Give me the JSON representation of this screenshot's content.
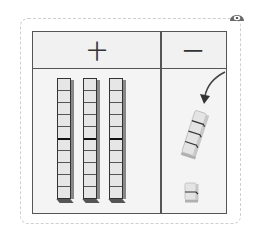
{
  "table": {
    "headers": [
      {
        "label": "十",
        "meaning": "tens"
      },
      {
        "label": "一",
        "meaning": "ones"
      }
    ],
    "tens_rods": 3,
    "rod_cells": 10,
    "ones_stack_cubes": 4,
    "ones_single_cubes": 1,
    "arrow": "curved arrow pointing down-left to tilted stack"
  },
  "icons": {
    "corner": "eye-icon"
  },
  "colors": {
    "border": "#555555",
    "rod_fill": "#e6e6e6",
    "background": "#f4f4f4",
    "frame_dashed": "#cfcfcf"
  }
}
